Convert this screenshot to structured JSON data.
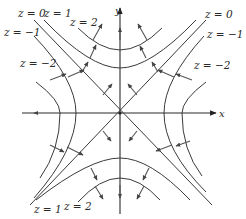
{
  "diagram": {
    "type": "contour-map-with-gradient-vectors",
    "function": "z = y^2 - x^2",
    "axes": {
      "x_label": "x",
      "y_label": "y"
    },
    "colors": {
      "curve": "#3a3a3a",
      "axis": "#2a2a2a",
      "arrow": "#555555",
      "background": "#ffffff"
    },
    "level_labels": [
      {
        "id": "z0-top-left",
        "text": "z = 0"
      },
      {
        "id": "z1-top-left",
        "text": "z = 1"
      },
      {
        "id": "z2-top-left",
        "text": "z = 2"
      },
      {
        "id": "zm1-top-left",
        "text": "z = −1"
      },
      {
        "id": "zm2-top-left",
        "text": "z = −2"
      },
      {
        "id": "z0-top-right",
        "text": "z = 0"
      },
      {
        "id": "zm1-top-right",
        "text": "z = −1"
      },
      {
        "id": "zm2-top-right",
        "text": "z = −2"
      },
      {
        "id": "z1-bottom",
        "text": "z = 1"
      },
      {
        "id": "z2-bottom",
        "text": "z = 2"
      }
    ],
    "levels": [
      -2,
      -1,
      0,
      1,
      2
    ]
  }
}
